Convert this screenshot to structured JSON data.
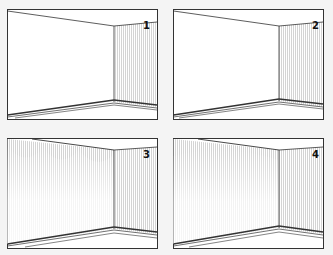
{
  "figure": {
    "colors": {
      "background": "#f4f4f4",
      "frame_fill": "#ffffff",
      "line": "#333333",
      "hatch": "#c8c8c8"
    },
    "panels": [
      {
        "label": "1",
        "left_wall_shaded": false,
        "right_wall_shaded": true,
        "shade_variant": "none"
      },
      {
        "label": "2",
        "left_wall_shaded": false,
        "right_wall_shaded": true,
        "shade_variant": "none"
      },
      {
        "label": "3",
        "left_wall_shaded": true,
        "right_wall_shaded": true,
        "shade_variant": "scallop"
      },
      {
        "label": "4",
        "left_wall_shaded": true,
        "right_wall_shaded": true,
        "shade_variant": "gradient"
      }
    ]
  }
}
